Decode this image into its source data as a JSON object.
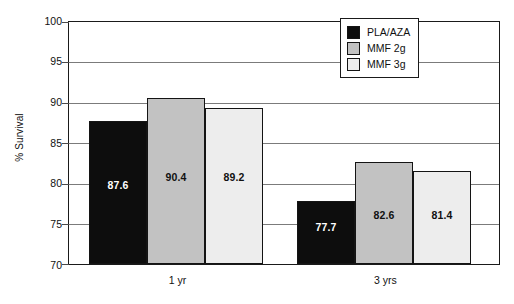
{
  "chart_data": {
    "type": "bar",
    "title": "",
    "subtitle": "",
    "xlabel": "",
    "ylabel": "% Survival",
    "categories": [
      "1 yr",
      "3 yrs"
    ],
    "series": [
      {
        "name": "PLA/AZA",
        "values": [
          87.6,
          89.2
        ],
        "color": "#0d0d0d",
        "label_color": "#ffffff"
      },
      {
        "name": "MMF 2g",
        "values": [
          90.4,
          82.6
        ],
        "color": "#c2c2c2",
        "label_color": "#111111"
      },
      {
        "name": "MMF 3g",
        "values": [
          89.2,
          81.4
        ],
        "color": "#ededed",
        "label_color": "#111111"
      }
    ],
    "data_labels": [
      [
        "87.6",
        "90.4",
        "89.2"
      ],
      [
        "77.7",
        "82.6",
        "81.4"
      ]
    ],
    "bar_values": [
      [
        87.6,
        90.4,
        89.2
      ],
      [
        77.7,
        82.6,
        81.4
      ]
    ],
    "ylim": [
      70,
      100
    ],
    "yticks": [
      70,
      75,
      80,
      85,
      90,
      95,
      100
    ],
    "ytick_labels": [
      "70",
      "75",
      "80",
      "85",
      "90",
      "95",
      "100"
    ],
    "grid": true,
    "grid_axis": "y",
    "legend_position": "top-right",
    "legend_entries": [
      "PLA/AZA",
      "MMF 2g",
      "MMF 3g"
    ]
  },
  "legend": {
    "items": [
      {
        "label": "PLA/AZA",
        "swatch": "#0d0d0d"
      },
      {
        "label": "MMF 2g",
        "swatch": "#c2c2c2"
      },
      {
        "label": "MMF 3g",
        "swatch": "#ededed"
      }
    ]
  },
  "axes": {
    "y_title": "% Survival",
    "y_tick_labels": [
      "100",
      "95",
      "90",
      "85",
      "80",
      "75",
      "70"
    ],
    "x_tick_labels": [
      "1 yr",
      "3 yrs"
    ]
  }
}
